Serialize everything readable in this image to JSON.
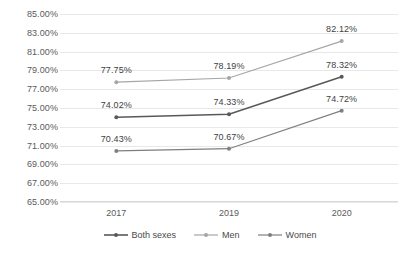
{
  "chart_data": {
    "type": "line",
    "title": "",
    "xlabel": "",
    "ylabel": "",
    "categories": [
      "2017",
      "2019",
      "2020"
    ],
    "ylim": [
      65,
      85
    ],
    "ytick_step": 2,
    "ytick_labels": [
      "85.00%",
      "83.00%",
      "81.00%",
      "79.00%",
      "77.00%",
      "75.00%",
      "73.00%",
      "71.00%",
      "69.00%",
      "67.00%",
      "65.00%"
    ],
    "ytick_values": [
      85,
      83,
      81,
      79,
      77,
      75,
      73,
      71,
      69,
      67,
      65
    ],
    "grid": true,
    "legend_position": "bottom",
    "series": [
      {
        "name": "Both sexes",
        "color": "#595959",
        "values": [
          74.02,
          74.33,
          78.32
        ],
        "labels": [
          "74.02%",
          "74.33%",
          "78.32%"
        ]
      },
      {
        "name": "Men",
        "color": "#a6a6a6",
        "values": [
          77.75,
          78.19,
          82.12
        ],
        "labels": [
          "77.75%",
          "78.19%",
          "82.12%"
        ]
      },
      {
        "name": "Women",
        "color": "#7f7f7f",
        "values": [
          70.43,
          70.67,
          74.72
        ],
        "labels": [
          "70.43%",
          "70.67%",
          "74.72%"
        ]
      }
    ]
  },
  "legend": {
    "items": [
      {
        "label": "Both sexes"
      },
      {
        "label": "Men"
      },
      {
        "label": "Women"
      }
    ]
  }
}
